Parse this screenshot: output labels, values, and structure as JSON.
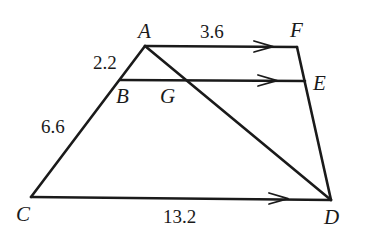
{
  "diagram": {
    "type": "geometry-figure",
    "points": {
      "A": {
        "label": "A",
        "x": 145,
        "y": 46
      },
      "F": {
        "label": "F",
        "x": 297,
        "y": 47
      },
      "B": {
        "label": "B",
        "x": 120,
        "y": 80
      },
      "E": {
        "label": "E",
        "x": 305,
        "y": 81
      },
      "G": {
        "label": "G",
        "x": 184,
        "y": 80
      },
      "C": {
        "label": "C",
        "x": 31,
        "y": 197
      },
      "D": {
        "label": "D",
        "x": 331,
        "y": 200
      }
    },
    "segments": [
      {
        "name": "AF",
        "from": "A",
        "to": "F",
        "parallel_marker": true
      },
      {
        "name": "BE",
        "from": "B",
        "to": "E",
        "parallel_marker": true
      },
      {
        "name": "CD",
        "from": "C",
        "to": "D",
        "parallel_marker": true
      },
      {
        "name": "AC",
        "from": "A",
        "to": "C"
      },
      {
        "name": "FD",
        "from": "F",
        "to": "D"
      },
      {
        "name": "AD",
        "from": "A",
        "to": "D"
      }
    ],
    "lengths": {
      "AB": "2.2",
      "BC": "6.6",
      "AF": "3.6",
      "CD": "13.2"
    },
    "labels": {
      "A": "A",
      "F": "F",
      "B": "B",
      "G": "G",
      "E": "E",
      "C": "C",
      "D": "D"
    },
    "colors": {
      "stroke": "#1a1a1a",
      "background": "#ffffff"
    }
  }
}
